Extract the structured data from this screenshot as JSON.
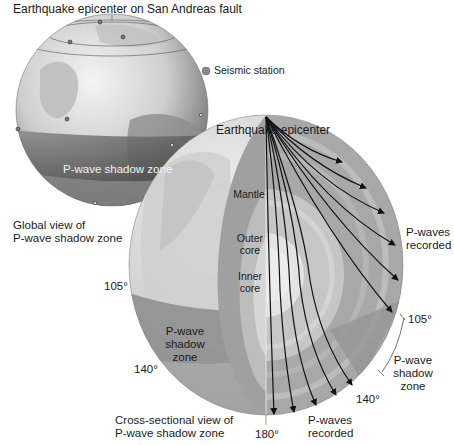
{
  "titles": {
    "top": "Earthquake epicenter on San Andreas fault",
    "epicenter": "Earthquake epicenter",
    "global_view": [
      "Global view of",
      "P-wave shadow zone"
    ],
    "cross_section": [
      "Cross-sectional view of",
      "P-wave shadow zone"
    ]
  },
  "legend": {
    "seismic_station": "Seismic station",
    "marker_color": "#8a8a8a"
  },
  "globe_small": {
    "shadow_zone_label": "P-wave shadow zone"
  },
  "globe_large": {
    "layers": [
      "Mantle",
      "Outer core",
      "Inner core"
    ],
    "layer_lines": {
      "mantle": [
        "Mantle"
      ],
      "outer_core": [
        "Outer",
        "core"
      ],
      "inner_core": [
        "Inner",
        "core"
      ]
    },
    "shadow_zone_left": [
      "P-wave",
      "shadow",
      "zone"
    ],
    "shadow_zone_right": [
      "P-wave",
      "shadow",
      "zone"
    ],
    "p_waves_recorded_right": [
      "P-waves",
      "recorded"
    ],
    "p_waves_recorded_bottom": [
      "P-waves",
      "recorded"
    ],
    "angles": {
      "left_105": "105°",
      "left_140": "140°",
      "right_105": "105°",
      "right_140": "140°",
      "bottom_180": "180°"
    }
  },
  "colors": {
    "surface_light": "#d9d9d9",
    "shadow_band": "#8f8f8f",
    "mantle": "#a8a8a8",
    "outer_core": "#c4c4c4",
    "inner_core": "#e2e2e2",
    "ray": "#111111"
  }
}
